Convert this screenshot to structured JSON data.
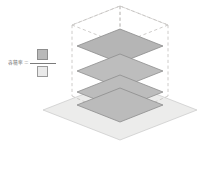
{
  "figure": {
    "background_color": "#ffffff"
  },
  "formula": {
    "label": "容積率＝",
    "numerator_name": "延べ床面積",
    "denominator_name": "敷地面積",
    "numerator_swatch_color": "#b9b9b9",
    "denominator_swatch_color": "#eaeaea",
    "bar_color": "#7b7b7b",
    "text_color": "#6d6d6d"
  },
  "diagram": {
    "site_plane": {
      "name": "site-area-plane",
      "fill": "#ececeb",
      "stroke": "#c9c9c9",
      "points": "120,80 197,110 120,140 43,110"
    },
    "envelope": {
      "name": "volume-envelope",
      "stroke": "#c2bfbd",
      "dash": "3.2 2.6",
      "apex": "120,6",
      "top_rhombus": "120,6 168,25 120,44 72,25",
      "verticals": [
        "72,25 72,96",
        "168,25 168,96",
        "120,6 120,118",
        "120,44 120,122"
      ],
      "lower_left": "72,96",
      "lower_right": "168,96",
      "lower_front": "120,118"
    },
    "floor_plates": [
      {
        "name": "floor-plate-4",
        "fill": "#b5b5b5",
        "stroke": "#8b8b8b",
        "points": "120,29 163,46 120,63 77,46"
      },
      {
        "name": "floor-plate-3",
        "fill": "#bdbdbd",
        "stroke": "#8e8e8e",
        "points": "120,54 163,71 120,88 77,71"
      },
      {
        "name": "floor-plate-2",
        "fill": "#bcbcbc",
        "stroke": "#8e8e8e",
        "points": "120,75 163,92 120,109 77,92"
      },
      {
        "name": "floor-plate-1",
        "fill": "#bbbbbb",
        "stroke": "#8d8d8d",
        "points": "120,88 163,105 120,122 77,105"
      }
    ]
  }
}
